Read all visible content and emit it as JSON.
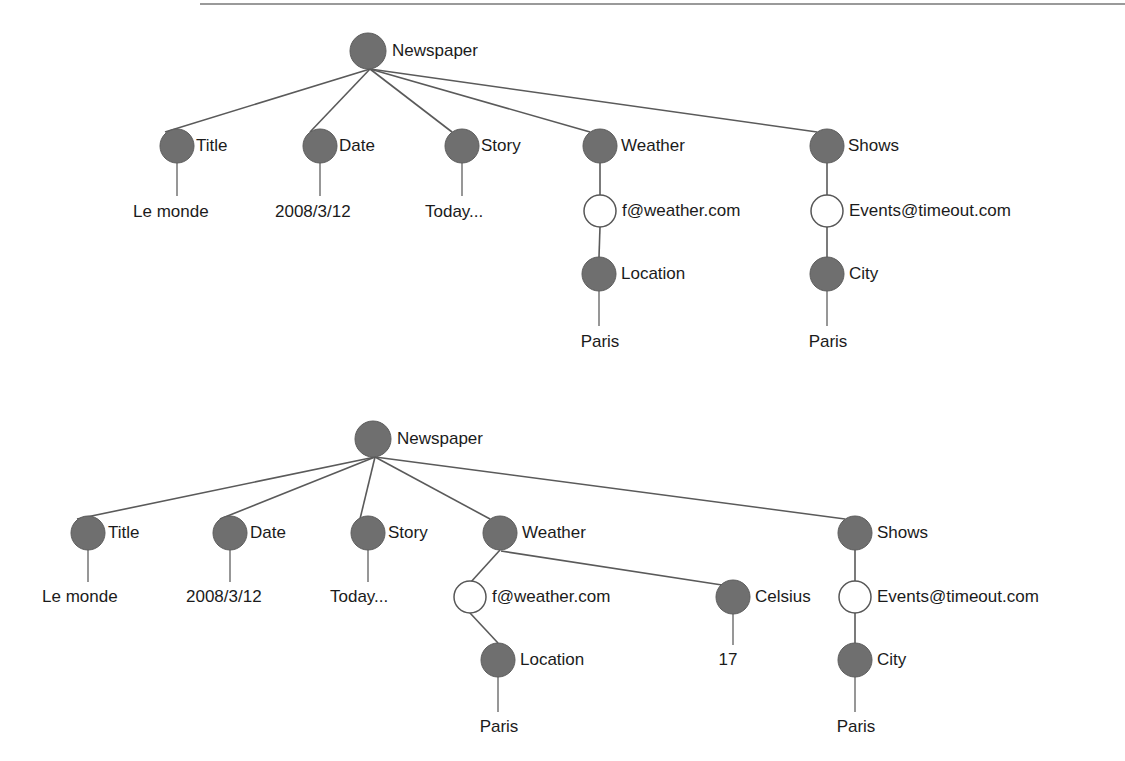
{
  "page": {
    "background_color": "#ffffff",
    "filled_node_color": "#6f6f6f",
    "open_node_color": "#ffffff",
    "edge_color": "#5a5a5a",
    "text_color": "#1b1b1b",
    "top_rule_color": "#9a9a9a"
  },
  "figures": [
    {
      "id": "figure-top",
      "name": "newspaper-graph-without-celsius",
      "root": {
        "label": "Newspaper",
        "type": "filled",
        "cx": 368,
        "cy": 51,
        "r": 18,
        "label_x": 392,
        "label_y": 52
      },
      "nodes": [
        {
          "id": "title",
          "label": "Title",
          "type": "filled",
          "cx": 177,
          "cy": 146,
          "r": 17,
          "label_x": 196,
          "label_y": 147
        },
        {
          "id": "date",
          "label": "Date",
          "type": "filled",
          "cx": 320,
          "cy": 146,
          "r": 17,
          "label_x": 339,
          "label_y": 147
        },
        {
          "id": "story",
          "label": "Story",
          "type": "filled",
          "cx": 462,
          "cy": 146,
          "r": 17,
          "label_x": 481,
          "label_y": 147
        },
        {
          "id": "weather",
          "label": "Weather",
          "type": "filled",
          "cx": 600,
          "cy": 146,
          "r": 17,
          "label_x": 621,
          "label_y": 147
        },
        {
          "id": "shows",
          "label": "Shows",
          "type": "filled",
          "cx": 827,
          "cy": 146,
          "r": 17,
          "label_x": 848,
          "label_y": 147
        },
        {
          "id": "fweather",
          "label": "f@weather.com",
          "type": "open",
          "cx": 600,
          "cy": 211,
          "r": 16,
          "label_x": 622,
          "label_y": 212
        },
        {
          "id": "events",
          "label": "Events@timeout.com",
          "type": "open",
          "cx": 827,
          "cy": 211,
          "r": 16,
          "label_x": 849,
          "label_y": 212
        },
        {
          "id": "location",
          "label": "Location",
          "type": "filled",
          "cx": 599,
          "cy": 274,
          "r": 17,
          "label_x": 621,
          "label_y": 275
        },
        {
          "id": "city",
          "label": "City",
          "type": "filled",
          "cx": 827,
          "cy": 274,
          "r": 17,
          "label_x": 849,
          "label_y": 275
        }
      ],
      "leaves": [
        {
          "id": "le-monde",
          "label": "Le monde",
          "x": 133,
          "y": 213,
          "anchor": "start",
          "stem_x": 177,
          "stem_y1": 163,
          "stem_y2": 196
        },
        {
          "id": "date-value",
          "label": "2008/3/12",
          "x": 275,
          "y": 213,
          "anchor": "start",
          "stem_x": 320,
          "stem_y1": 163,
          "stem_y2": 196
        },
        {
          "id": "story-value",
          "label": "Today...",
          "x": 425,
          "y": 213,
          "anchor": "start",
          "stem_x": 462,
          "stem_y1": 163,
          "stem_y2": 196
        },
        {
          "id": "paris-loc",
          "label": "Paris",
          "x": 600,
          "y": 343,
          "anchor": "middle",
          "stem_x": 599,
          "stem_y1": 291,
          "stem_y2": 326
        },
        {
          "id": "paris-city",
          "label": "Paris",
          "x": 828,
          "y": 343,
          "anchor": "middle",
          "stem_x": 827,
          "stem_y1": 291,
          "stem_y2": 326
        }
      ],
      "edges": [
        {
          "from": "Newspaper",
          "to": "Title",
          "x1": 370,
          "y1": 69,
          "x2": 165,
          "y2": 132
        },
        {
          "from": "Newspaper",
          "to": "Date",
          "x1": 370,
          "y1": 69,
          "x2": 310,
          "y2": 132
        },
        {
          "from": "Newspaper",
          "to": "Story",
          "x1": 370,
          "y1": 69,
          "x2": 452,
          "y2": 132
        },
        {
          "from": "Newspaper",
          "to": "Weather",
          "x1": 370,
          "y1": 69,
          "x2": 590,
          "y2": 132
        },
        {
          "from": "Newspaper",
          "to": "Shows",
          "x1": 370,
          "y1": 69,
          "x2": 817,
          "y2": 132
        },
        {
          "from": "Weather",
          "to": "f@weather.com",
          "x1": 600,
          "y1": 163,
          "x2": 600,
          "y2": 195
        },
        {
          "from": "Shows",
          "to": "Events@timeout.com",
          "x1": 827,
          "y1": 163,
          "x2": 827,
          "y2": 195
        },
        {
          "from": "f@weather.com",
          "to": "Location",
          "x1": 600,
          "y1": 227,
          "x2": 599,
          "y2": 257
        },
        {
          "from": "Events@timeout.com",
          "to": "City",
          "x1": 827,
          "y1": 227,
          "x2": 827,
          "y2": 257
        }
      ]
    },
    {
      "id": "figure-bottom",
      "name": "newspaper-graph-with-celsius",
      "root": {
        "label": "Newspaper",
        "type": "filled",
        "cx": 373,
        "cy": 439,
        "r": 18,
        "label_x": 397,
        "label_y": 440
      },
      "nodes": [
        {
          "id": "title",
          "label": "Title",
          "type": "filled",
          "cx": 88,
          "cy": 533,
          "r": 17,
          "label_x": 108,
          "label_y": 534
        },
        {
          "id": "date",
          "label": "Date",
          "type": "filled",
          "cx": 230,
          "cy": 533,
          "r": 17,
          "label_x": 250,
          "label_y": 534
        },
        {
          "id": "story",
          "label": "Story",
          "type": "filled",
          "cx": 368,
          "cy": 533,
          "r": 17,
          "label_x": 388,
          "label_y": 534
        },
        {
          "id": "weather",
          "label": "Weather",
          "type": "filled",
          "cx": 500,
          "cy": 533,
          "r": 17,
          "label_x": 522,
          "label_y": 534
        },
        {
          "id": "shows",
          "label": "Shows",
          "type": "filled",
          "cx": 855,
          "cy": 533,
          "r": 17,
          "label_x": 877,
          "label_y": 534
        },
        {
          "id": "fweather",
          "label": "f@weather.com",
          "type": "open",
          "cx": 470,
          "cy": 597,
          "r": 16,
          "label_x": 492,
          "label_y": 598
        },
        {
          "id": "celsius",
          "label": "Celsius",
          "type": "filled",
          "cx": 733,
          "cy": 597,
          "r": 17,
          "label_x": 755,
          "label_y": 598
        },
        {
          "id": "events",
          "label": "Events@timeout.com",
          "type": "open",
          "cx": 855,
          "cy": 597,
          "r": 16,
          "label_x": 877,
          "label_y": 598
        },
        {
          "id": "location",
          "label": "Location",
          "type": "filled",
          "cx": 498,
          "cy": 660,
          "r": 17,
          "label_x": 520,
          "label_y": 661
        },
        {
          "id": "city",
          "label": "City",
          "type": "filled",
          "cx": 855,
          "cy": 660,
          "r": 17,
          "label_x": 877,
          "label_y": 661
        }
      ],
      "leaves": [
        {
          "id": "le-monde",
          "label": "Le monde",
          "x": 42,
          "y": 598,
          "anchor": "start",
          "stem_x": 88,
          "stem_y1": 550,
          "stem_y2": 582
        },
        {
          "id": "date-value",
          "label": "2008/3/12",
          "x": 186,
          "y": 598,
          "anchor": "start",
          "stem_x": 230,
          "stem_y1": 550,
          "stem_y2": 582
        },
        {
          "id": "story-value",
          "label": "Today...",
          "x": 330,
          "y": 598,
          "anchor": "start",
          "stem_x": 368,
          "stem_y1": 550,
          "stem_y2": 582
        },
        {
          "id": "celsius-value",
          "label": "17",
          "x": 728,
          "y": 661,
          "anchor": "middle",
          "stem_x": 733,
          "stem_y1": 614,
          "stem_y2": 645
        },
        {
          "id": "paris-loc",
          "label": "Paris",
          "x": 499,
          "y": 728,
          "anchor": "middle",
          "stem_x": 498,
          "stem_y1": 677,
          "stem_y2": 712
        },
        {
          "id": "paris-city",
          "label": "Paris",
          "x": 856,
          "y": 728,
          "anchor": "middle",
          "stem_x": 855,
          "stem_y1": 677,
          "stem_y2": 712
        }
      ],
      "edges": [
        {
          "from": "Newspaper",
          "to": "Title",
          "x1": 375,
          "y1": 457,
          "x2": 77,
          "y2": 519
        },
        {
          "from": "Newspaper",
          "to": "Date",
          "x1": 375,
          "y1": 457,
          "x2": 220,
          "y2": 519
        },
        {
          "from": "Newspaper",
          "to": "Story",
          "x1": 375,
          "y1": 457,
          "x2": 360,
          "y2": 519
        },
        {
          "from": "Newspaper",
          "to": "Weather",
          "x1": 375,
          "y1": 457,
          "x2": 490,
          "y2": 519
        },
        {
          "from": "Newspaper",
          "to": "Shows",
          "x1": 375,
          "y1": 457,
          "x2": 845,
          "y2": 519
        },
        {
          "from": "Weather",
          "to": "f@weather.com",
          "x1": 500,
          "y1": 550,
          "x2": 470,
          "y2": 582
        },
        {
          "from": "Weather",
          "to": "Celsius",
          "x1": 501,
          "y1": 551,
          "x2": 722,
          "y2": 585
        },
        {
          "from": "Shows",
          "to": "Events@timeout.com",
          "x1": 855,
          "y1": 550,
          "x2": 855,
          "y2": 582
        },
        {
          "from": "f@weather.com",
          "to": "Location",
          "x1": 470,
          "y1": 613,
          "x2": 498,
          "y2": 643
        },
        {
          "from": "Events@timeout.com",
          "to": "City",
          "x1": 855,
          "y1": 613,
          "x2": 855,
          "y2": 643
        }
      ]
    }
  ]
}
